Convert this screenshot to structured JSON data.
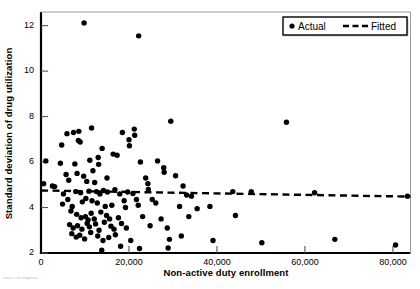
{
  "chart_data": {
    "type": "scatter",
    "title": "",
    "xlabel": "Non-active duty enrollment",
    "ylabel": "Standard deviation of drug utilization",
    "xlim": [
      0,
      84000
    ],
    "ylim": [
      2,
      12.6
    ],
    "xticks": [
      0,
      20000,
      40000,
      60000,
      80000
    ],
    "xticklabels": [
      "0",
      "20,000",
      "40,000",
      "60,000",
      "80,000"
    ],
    "yticks": [
      2,
      4,
      6,
      8,
      10,
      12
    ],
    "yticklabels": [
      "2",
      "4",
      "6",
      "8",
      "10",
      "12"
    ],
    "grid": false,
    "legend_position": "top-right",
    "series": [
      {
        "name": "Actual",
        "type": "scatter",
        "marker": "circle",
        "color": "#000000",
        "points": [
          [
            9800,
            12.12
          ],
          [
            22200,
            11.55
          ],
          [
            11500,
            7.5
          ],
          [
            5900,
            7.25
          ],
          [
            7400,
            7.3
          ],
          [
            8600,
            7.35
          ],
          [
            18500,
            7.3
          ],
          [
            21200,
            7.45
          ],
          [
            21300,
            7.18
          ],
          [
            29500,
            7.8
          ],
          [
            55800,
            7.75
          ],
          [
            4700,
            6.75
          ],
          [
            8500,
            6.95
          ],
          [
            8900,
            6.88
          ],
          [
            13900,
            6.6
          ],
          [
            16400,
            6.35
          ],
          [
            20000,
            6.98
          ],
          [
            20100,
            6.72
          ],
          [
            1100,
            6.05
          ],
          [
            4400,
            5.95
          ],
          [
            7700,
            5.92
          ],
          [
            11100,
            6.08
          ],
          [
            13000,
            6.2
          ],
          [
            13100,
            5.9
          ],
          [
            17300,
            6.3
          ],
          [
            22600,
            6.0
          ],
          [
            26500,
            6.05
          ],
          [
            27900,
            5.75
          ],
          [
            28000,
            5.55
          ],
          [
            5700,
            5.45
          ],
          [
            6300,
            5.2
          ],
          [
            8200,
            5.5
          ],
          [
            9700,
            5.38
          ],
          [
            10400,
            5.15
          ],
          [
            11800,
            5.62
          ],
          [
            12200,
            5.1
          ],
          [
            15000,
            5.3
          ],
          [
            23800,
            5.3
          ],
          [
            24300,
            5.05
          ],
          [
            24400,
            4.8
          ],
          [
            30600,
            5.4
          ],
          [
            32300,
            4.95
          ],
          [
            600,
            5.05
          ],
          [
            2600,
            4.95
          ],
          [
            3100,
            4.92
          ],
          [
            5100,
            4.6
          ],
          [
            7900,
            4.7
          ],
          [
            9000,
            4.65
          ],
          [
            10900,
            4.72
          ],
          [
            12600,
            4.7
          ],
          [
            13400,
            4.6
          ],
          [
            14200,
            4.75
          ],
          [
            15100,
            4.68
          ],
          [
            16800,
            4.78
          ],
          [
            17900,
            4.6
          ],
          [
            19700,
            4.68
          ],
          [
            20900,
            4.62
          ],
          [
            33100,
            4.55
          ],
          [
            34200,
            4.5
          ],
          [
            43600,
            4.7
          ],
          [
            47800,
            4.7
          ],
          [
            62200,
            4.65
          ],
          [
            83300,
            4.5
          ],
          [
            4900,
            4.15
          ],
          [
            6100,
            4.35
          ],
          [
            7100,
            4.05
          ],
          [
            9400,
            4.25
          ],
          [
            10200,
            4.4
          ],
          [
            11600,
            4.3
          ],
          [
            12800,
            4.2
          ],
          [
            14600,
            4.05
          ],
          [
            16100,
            4.1
          ],
          [
            18900,
            4.3
          ],
          [
            19200,
            4.0
          ],
          [
            21700,
            4.35
          ],
          [
            22100,
            4.1
          ],
          [
            25300,
            4.35
          ],
          [
            26100,
            4.2
          ],
          [
            31500,
            4.05
          ],
          [
            35500,
            3.95
          ],
          [
            38400,
            4.05
          ],
          [
            6800,
            3.85
          ],
          [
            8100,
            3.7
          ],
          [
            9100,
            3.55
          ],
          [
            10100,
            3.6
          ],
          [
            10700,
            3.45
          ],
          [
            11400,
            3.75
          ],
          [
            12100,
            3.5
          ],
          [
            13600,
            3.8
          ],
          [
            14900,
            3.65
          ],
          [
            15600,
            3.5
          ],
          [
            17600,
            3.55
          ],
          [
            23100,
            3.6
          ],
          [
            27300,
            3.5
          ],
          [
            33600,
            3.6
          ],
          [
            44200,
            3.65
          ],
          [
            6500,
            3.25
          ],
          [
            7300,
            3.1
          ],
          [
            8300,
            3.2
          ],
          [
            9300,
            3.05
          ],
          [
            10500,
            3.3
          ],
          [
            11000,
            3.15
          ],
          [
            12400,
            3.28
          ],
          [
            13200,
            3.0
          ],
          [
            14400,
            3.35
          ],
          [
            15900,
            3.18
          ],
          [
            16600,
            3.05
          ],
          [
            18300,
            3.3
          ],
          [
            19400,
            3.1
          ],
          [
            24800,
            3.2
          ],
          [
            28700,
            3.1
          ],
          [
            7000,
            2.85
          ],
          [
            8000,
            2.7
          ],
          [
            8800,
            2.78
          ],
          [
            9900,
            2.62
          ],
          [
            11300,
            2.9
          ],
          [
            12900,
            2.75
          ],
          [
            14100,
            2.55
          ],
          [
            15400,
            2.68
          ],
          [
            16900,
            2.8
          ],
          [
            20400,
            2.55
          ],
          [
            29200,
            2.6
          ],
          [
            31900,
            2.75
          ],
          [
            39100,
            2.55
          ],
          [
            50200,
            2.45
          ],
          [
            66800,
            2.6
          ],
          [
            80600,
            2.35
          ],
          [
            13800,
            2.12
          ],
          [
            18100,
            2.3
          ],
          [
            22400,
            2.2
          ],
          [
            28900,
            2.22
          ]
        ]
      },
      {
        "name": "Fitted",
        "type": "line",
        "style": "dashed",
        "color": "#000000",
        "points": [
          [
            0,
            4.75
          ],
          [
            84000,
            4.48
          ]
        ]
      }
    ],
    "legend": [
      {
        "label": "Actual",
        "marker": "circle"
      },
      {
        "label": "Fitted",
        "marker": "dashed-line"
      }
    ]
  },
  "footnote": "source line fragment"
}
